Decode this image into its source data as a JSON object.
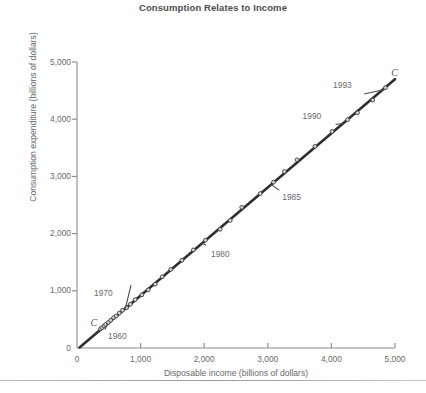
{
  "chart_data": {
    "type": "scatter",
    "title": "Consumption Relates to Income",
    "xlabel": "Disposable income (billions of dollars)",
    "ylabel": "Consumption expenditure (billions of dollars)",
    "xlim": [
      0,
      5000
    ],
    "ylim": [
      0,
      5000
    ],
    "xticks": [
      "0",
      "1,000",
      "2,000",
      "3,000",
      "4,000",
      "5,000"
    ],
    "xtick_values": [
      0,
      1000,
      2000,
      3000,
      4000,
      5000
    ],
    "yticks": [
      "0",
      "1,000",
      "2,000",
      "3,000",
      "4,000",
      "5,000"
    ],
    "ytick_values": [
      0,
      1000,
      2000,
      3000,
      4000,
      5000
    ],
    "grid": false,
    "legend": "none",
    "series": [
      {
        "name": "Consumption expenditure vs disposable income, 1960-1993",
        "marker": "dot",
        "points": [
          {
            "year": 1960,
            "x": 370,
            "y": 335
          },
          {
            "year": 1961,
            "x": 395,
            "y": 355
          },
          {
            "year": 1962,
            "x": 425,
            "y": 385
          },
          {
            "year": 1963,
            "x": 450,
            "y": 410
          },
          {
            "year": 1964,
            "x": 490,
            "y": 445
          },
          {
            "year": 1965,
            "x": 530,
            "y": 485
          },
          {
            "year": 1966,
            "x": 575,
            "y": 530
          },
          {
            "year": 1967,
            "x": 615,
            "y": 560
          },
          {
            "year": 1968,
            "x": 665,
            "y": 610
          },
          {
            "year": 1969,
            "x": 715,
            "y": 660
          },
          {
            "year": 1970,
            "x": 780,
            "y": 705
          },
          {
            "year": 1971,
            "x": 840,
            "y": 765
          },
          {
            "year": 1972,
            "x": 915,
            "y": 845
          },
          {
            "year": 1973,
            "x": 1020,
            "y": 930
          },
          {
            "year": 1974,
            "x": 1120,
            "y": 1015
          },
          {
            "year": 1975,
            "x": 1230,
            "y": 1115
          },
          {
            "year": 1976,
            "x": 1340,
            "y": 1245
          },
          {
            "year": 1977,
            "x": 1475,
            "y": 1375
          },
          {
            "year": 1978,
            "x": 1650,
            "y": 1535
          },
          {
            "year": 1979,
            "x": 1830,
            "y": 1715
          },
          {
            "year": 1980,
            "x": 2020,
            "y": 1885
          },
          {
            "year": 1981,
            "x": 2250,
            "y": 2075
          },
          {
            "year": 1982,
            "x": 2410,
            "y": 2230
          },
          {
            "year": 1983,
            "x": 2590,
            "y": 2460
          },
          {
            "year": 1984,
            "x": 2880,
            "y": 2700
          },
          {
            "year": 1985,
            "x": 3090,
            "y": 2900
          },
          {
            "year": 1986,
            "x": 3260,
            "y": 3085
          },
          {
            "year": 1987,
            "x": 3460,
            "y": 3290
          },
          {
            "year": 1988,
            "x": 3740,
            "y": 3525
          },
          {
            "year": 1989,
            "x": 4010,
            "y": 3785
          },
          {
            "year": 1990,
            "x": 4255,
            "y": 3990
          },
          {
            "year": 1991,
            "x": 4410,
            "y": 4110
          },
          {
            "year": 1992,
            "x": 4650,
            "y": 4335
          },
          {
            "year": 1993,
            "x": 4850,
            "y": 4550
          }
        ]
      }
    ],
    "trend_line": {
      "name": "C",
      "from": {
        "x": 40,
        "y": 10
      },
      "to": {
        "x": 5000,
        "y": 4700
      }
    },
    "annotations": [
      {
        "label": "1960",
        "x": 660,
        "y": 200
      },
      {
        "label": "1970",
        "x": 440,
        "y": 940
      },
      {
        "label": "1980",
        "x": 2280,
        "y": 1620
      },
      {
        "label": "1985",
        "x": 3400,
        "y": 2620
      },
      {
        "label": "1990",
        "x": 3720,
        "y": 4030
      },
      {
        "label": "1993",
        "x": 4200,
        "y": 4580
      },
      {
        "label": "C",
        "x": 260,
        "y": 440
      },
      {
        "label": "C",
        "x": 4990,
        "y": 4800
      }
    ]
  }
}
